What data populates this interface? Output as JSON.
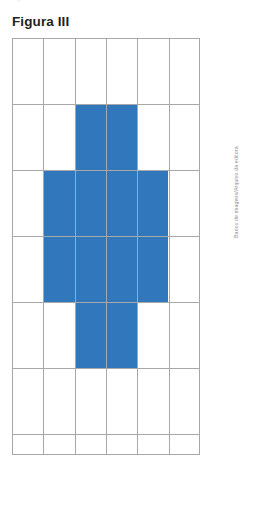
{
  "page": {
    "top_cut_text": "·                                        ·                           ○",
    "background_color": "#ffffff"
  },
  "figure": {
    "title": "Figura III",
    "credit": "Banco de imagens/Arquivo da editora",
    "shape_color": "#3077BC",
    "grid_line_color": "#a8a8ab",
    "title_color": "#231f20"
  },
  "chart_data": {
    "type": "heatmap",
    "title": "Figura III",
    "xlabel": "",
    "ylabel": "",
    "columns": 6,
    "rows": 6,
    "cell_width": 31.3,
    "cell_height": 66,
    "grid": true,
    "legend": "none",
    "filled_color": "#3077BC",
    "empty_color": "#ffffff",
    "filled_count": 12,
    "values": [
      [
        0,
        0,
        0,
        0,
        0,
        0
      ],
      [
        0,
        0,
        1,
        1,
        0,
        0
      ],
      [
        0,
        1,
        1,
        1,
        1,
        0
      ],
      [
        0,
        1,
        1,
        1,
        1,
        0
      ],
      [
        0,
        0,
        1,
        1,
        0,
        0
      ],
      [
        0,
        0,
        0,
        0,
        0,
        0
      ]
    ],
    "filled_cells": [
      {
        "row": 2,
        "col": 3
      },
      {
        "row": 2,
        "col": 4
      },
      {
        "row": 3,
        "col": 2
      },
      {
        "row": 3,
        "col": 3
      },
      {
        "row": 3,
        "col": 4
      },
      {
        "row": 3,
        "col": 5
      },
      {
        "row": 4,
        "col": 2
      },
      {
        "row": 4,
        "col": 3
      },
      {
        "row": 4,
        "col": 4
      },
      {
        "row": 4,
        "col": 5
      },
      {
        "row": 5,
        "col": 3
      },
      {
        "row": 5,
        "col": 4
      }
    ],
    "blue_blocks": [
      {
        "name": "top-arm",
        "x": 62.6,
        "y": 66,
        "w": 62.6,
        "h": 66
      },
      {
        "name": "middle-bar",
        "x": 31.3,
        "y": 132,
        "w": 125.2,
        "h": 132
      },
      {
        "name": "bottom-arm",
        "x": 62.6,
        "y": 264,
        "w": 62.6,
        "h": 66
      }
    ],
    "vertical_lines_x": [
      0,
      31.3,
      62.6,
      93.9,
      125.2,
      156.5,
      187
    ],
    "horizontal_lines_y": [
      0,
      66,
      132,
      198,
      264,
      330,
      396,
      416
    ]
  }
}
